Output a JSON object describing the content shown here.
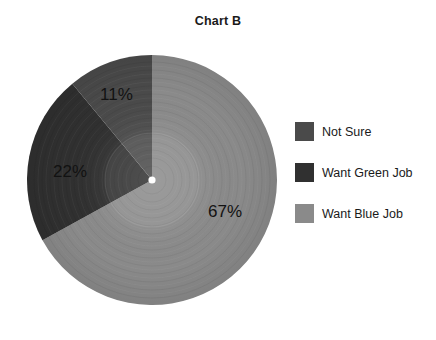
{
  "chart_data": {
    "type": "pie",
    "title": "Chart B",
    "subtitle": "",
    "xlabel": "",
    "ylabel": "",
    "legend_position": "right",
    "grid": false,
    "categories": [
      "Want Blue Job",
      "Want Green Job",
      "Not Sure"
    ],
    "values": [
      67,
      22,
      11
    ],
    "unit": "%",
    "data_labels": [
      "67%",
      "22%",
      "11%"
    ],
    "colors": [
      "#8a8a8a",
      "#303030",
      "#4a4a4a"
    ],
    "slices": [
      {
        "label": "Want Blue Job",
        "value": 67,
        "data_label": "67%",
        "color": "#8a8a8a",
        "start_angle_deg": 0,
        "end_angle_deg": 241.2
      },
      {
        "label": "Want Green Job",
        "value": 22,
        "data_label": "22%",
        "color": "#303030",
        "start_angle_deg": 241.2,
        "end_angle_deg": 320.4
      },
      {
        "label": "Not Sure",
        "value": 11,
        "data_label": "11%",
        "color": "#4a4a4a",
        "start_angle_deg": 320.4,
        "end_angle_deg": 360
      }
    ]
  },
  "title": {
    "text": "Chart B"
  },
  "legend": {
    "items": [
      {
        "label": "Not Sure",
        "color": "#4a4a4a"
      },
      {
        "label": "Want Green Job",
        "color": "#303030"
      },
      {
        "label": "Want Blue Job",
        "color": "#8a8a8a"
      }
    ]
  },
  "labels": {
    "blue_job": "67%",
    "green_job": "22%",
    "not_sure": "11%"
  }
}
